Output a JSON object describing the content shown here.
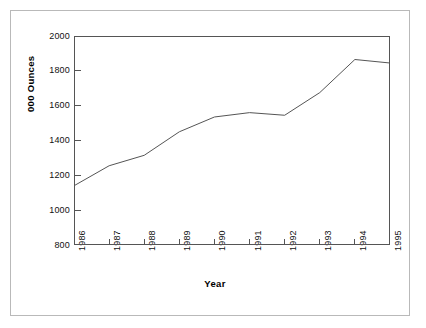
{
  "chart_data": {
    "type": "line",
    "title": "",
    "subtitle": "",
    "xlabel": "Year",
    "ylabel": "000 Ounces",
    "categories": [
      "1986",
      "1987",
      "1988",
      "1989",
      "1990",
      "1991",
      "1992",
      "1993",
      "1994",
      "1995"
    ],
    "x": [
      1986,
      1987,
      1988,
      1989,
      1990,
      1991,
      1992,
      1993,
      1994,
      1995
    ],
    "values": [
      1140,
      1255,
      1315,
      1450,
      1535,
      1560,
      1545,
      1675,
      1865,
      1845
    ],
    "series": [
      {
        "name": "000 Ounces",
        "values": [
          1140,
          1255,
          1315,
          1450,
          1535,
          1560,
          1545,
          1675,
          1865,
          1845
        ]
      }
    ],
    "ylim": [
      800,
      2000
    ],
    "ytick_values": [
      800,
      1000,
      1200,
      1400,
      1600,
      1800,
      2000
    ],
    "ytick_labels": [
      "800",
      "1000",
      "1200",
      "1400",
      "1600",
      "1800",
      "2000"
    ],
    "xtick_labels": [
      "1986",
      "1987",
      "1988",
      "1989",
      "1990",
      "1991",
      "1992",
      "1993",
      "1994",
      "1995"
    ],
    "grid": false,
    "legend": "none",
    "line_color": "#555555",
    "axis_color": "#555555",
    "frame_color": "#b9b9b9",
    "background_color": "#ffffff"
  }
}
